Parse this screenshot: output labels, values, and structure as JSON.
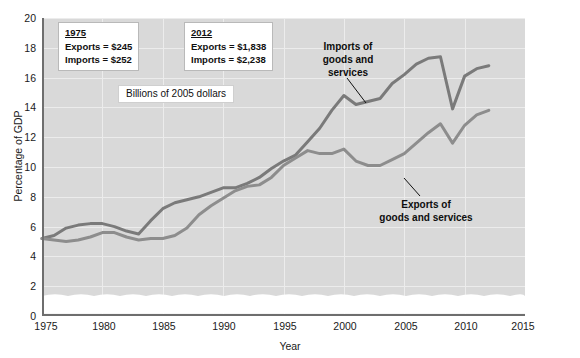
{
  "chart_data": {
    "type": "line",
    "title": "",
    "xlabel": "Year",
    "ylabel": "Percentage of GDP",
    "xlim": [
      1975,
      2015
    ],
    "ylim": [
      0,
      20
    ],
    "grid": true,
    "legend_position": "inline-annotation",
    "xticks": [
      "1975",
      "1980",
      "1985",
      "1990",
      "1995",
      "2000",
      "2005",
      "2010",
      "2015"
    ],
    "yticks": [
      "0",
      "2",
      "4",
      "6",
      "8",
      "10",
      "12",
      "14",
      "16",
      "18",
      "20"
    ],
    "axis_break_note": "wavy break band near zero baseline",
    "x": [
      1975,
      1976,
      1977,
      1978,
      1979,
      1980,
      1981,
      1982,
      1983,
      1984,
      1985,
      1986,
      1987,
      1988,
      1989,
      1990,
      1991,
      1992,
      1993,
      1994,
      1995,
      1996,
      1997,
      1998,
      1999,
      2000,
      2001,
      2002,
      2003,
      2004,
      2005,
      2006,
      2007,
      2008,
      2009,
      2010,
      2011,
      2012
    ],
    "series": [
      {
        "name": "Imports of goods and services",
        "color": "#7a7a7a",
        "values": [
          5.2,
          5.4,
          5.9,
          6.1,
          6.2,
          6.2,
          6.0,
          5.7,
          5.5,
          6.4,
          7.2,
          7.6,
          7.8,
          8.0,
          8.3,
          8.6,
          8.6,
          8.9,
          9.3,
          9.9,
          10.4,
          10.8,
          11.7,
          12.6,
          13.8,
          14.8,
          14.2,
          14.4,
          14.6,
          15.6,
          16.2,
          16.9,
          17.3,
          17.4,
          13.9,
          16.1,
          16.6,
          16.8
        ]
      },
      {
        "name": "Exports of goods and services",
        "color": "#8d8d8d",
        "values": [
          5.2,
          5.1,
          5.0,
          5.1,
          5.3,
          5.6,
          5.6,
          5.3,
          5.1,
          5.2,
          5.2,
          5.4,
          5.9,
          6.8,
          7.4,
          7.9,
          8.4,
          8.7,
          8.8,
          9.3,
          10.1,
          10.6,
          11.1,
          10.9,
          10.9,
          11.2,
          10.4,
          10.1,
          10.1,
          10.5,
          10.9,
          11.6,
          12.3,
          12.9,
          11.6,
          12.8,
          13.5,
          13.8
        ]
      }
    ],
    "annotations": [
      {
        "id": "callout-1975",
        "header": "1975",
        "rows": [
          "Exports  =  $245",
          "Imports  =  $252"
        ]
      },
      {
        "id": "callout-2012",
        "header": "2012",
        "rows": [
          "Exports  =  $1,838",
          "Imports  =  $2,238"
        ]
      },
      {
        "id": "units-note",
        "text": "Billions of 2005 dollars"
      },
      {
        "id": "imports-label",
        "line1": "Imports of",
        "line2": "goods and",
        "line3": "services"
      },
      {
        "id": "exports-label",
        "line1": "Exports of",
        "line2": "goods and services"
      }
    ]
  },
  "colors": {
    "plot_background": "#d9d9d9",
    "grid": "#ececec",
    "axis": "#6e6e6e",
    "imports_line": "#7a7a7a",
    "exports_line": "#8d8d8d",
    "break_band": "#ffffff"
  }
}
